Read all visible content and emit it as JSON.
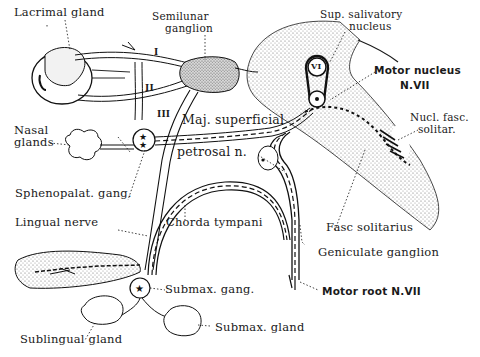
{
  "diagram": {
    "labels": {
      "lacrimal_gland": "Lacrimal gland",
      "semilunar_ganglion_1": "Semilunar",
      "semilunar_ganglion_2": "ganglion",
      "sup_salivatory_1": "Sup. salivatory",
      "sup_salivatory_2": "nucleus",
      "motor_nucleus_1": "Motor nucleus",
      "motor_nucleus_2": "N.VII",
      "nasal_glands_1": "Nasal",
      "nasal_glands_2": "glands",
      "maj_superficial": "Maj. superficial",
      "petrosal_n": "petrosal n.",
      "nucl_fasc_1": "Nucl. fasc.",
      "nucl_fasc_2": "solitar.",
      "sphenopalat_gang": "Sphenopalat. gang.",
      "lingual_nerve": "Lingual nerve",
      "chorda_tympani": "Chorda tympani",
      "fasc_solitarius": "Fasc solitarius",
      "geniculate_ganglion": "Geniculate ganglion",
      "submax_gang": "Submax. gang.",
      "motor_root": "Motor root N.VII",
      "sublingual_gland": "Sublingual gland",
      "submax_gland": "Submax. gland"
    },
    "nerve_numerals": {
      "n1": "I",
      "n2": "II",
      "n3": "III",
      "n6": "VI"
    },
    "colors": {
      "ink": "#1a1a1a",
      "background": "#ffffff",
      "stipple": "#8a8a8a"
    }
  }
}
